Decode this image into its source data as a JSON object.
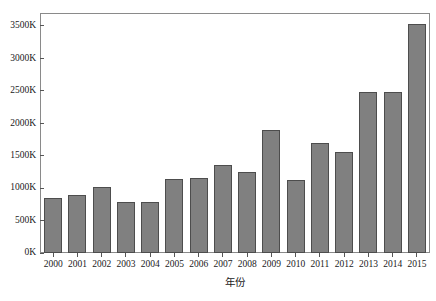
{
  "chart_data": {
    "type": "bar",
    "title": "",
    "subtitle": "",
    "xlabel": "年份",
    "ylabel": "",
    "categories": [
      "2000",
      "2001",
      "2002",
      "2003",
      "2004",
      "2005",
      "2006",
      "2007",
      "2008",
      "2009",
      "2010",
      "2011",
      "2012",
      "2013",
      "2014",
      "2015"
    ],
    "values": [
      850000,
      890000,
      1020000,
      780000,
      790000,
      1140000,
      1150000,
      1360000,
      1250000,
      1900000,
      1120000,
      1700000,
      1560000,
      2480000,
      2480000,
      3530000
    ],
    "ylim": [
      0,
      3700000
    ],
    "y_ticks": [
      0,
      500000,
      1000000,
      1500000,
      2000000,
      2500000,
      3000000,
      3500000
    ],
    "y_tick_labels": [
      "0K",
      "500K",
      "1000K",
      "1500K",
      "2000K",
      "2500K",
      "3000K",
      "3500K"
    ],
    "grid": false,
    "legend": null,
    "legend_position": "none",
    "bar_fill_color": "#808080",
    "bar_edge_color": "#4d4d4d",
    "frame_color": "#8a8a8a",
    "background_color": "#ffffff",
    "series": [
      {
        "name": "",
        "values": [
          850000,
          890000,
          1020000,
          780000,
          790000,
          1140000,
          1150000,
          1360000,
          1250000,
          1900000,
          1120000,
          1700000,
          1560000,
          2480000,
          2480000,
          3530000
        ]
      }
    ]
  }
}
